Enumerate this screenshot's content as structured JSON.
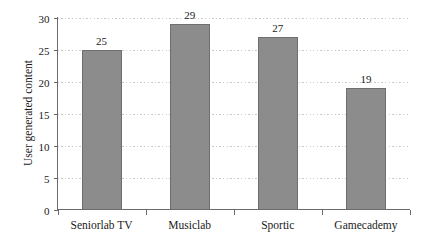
{
  "chart_data": {
    "type": "bar",
    "title": "",
    "xlabel": "",
    "ylabel": "User generated content",
    "categories": [
      "Seniorlab TV",
      "Musiclab",
      "Sportic",
      "Gamecademy"
    ],
    "values": [
      25,
      29,
      27,
      19
    ],
    "value_labels": [
      "25",
      "29",
      "27",
      "19"
    ],
    "ylim": [
      0,
      30
    ],
    "y_ticks": [
      0,
      5,
      10,
      15,
      20,
      25,
      30
    ],
    "y_tick_labels": [
      "0",
      "5",
      "10",
      "15",
      "20",
      "25",
      "30"
    ],
    "grid": true,
    "grid_axis": "y",
    "legend": "none",
    "bar_color": "#8c8c8c",
    "bar_edge_color": "#6f6f6f",
    "grid_color": "#c9c9c9",
    "axis_color": "#6b6b6b",
    "text_color": "#1a1a1a",
    "background_color": "#ffffff"
  }
}
